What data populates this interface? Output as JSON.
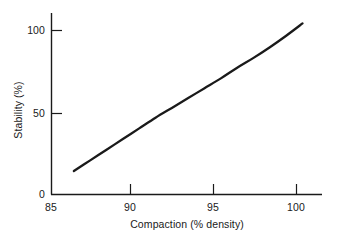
{
  "chart_data": {
    "type": "line",
    "title": "",
    "subtitle": "",
    "xlabel": "Compaction (% density)",
    "ylabel": "Stability (%)",
    "xlim": [
      85,
      101.6
    ],
    "ylim": [
      0,
      110
    ],
    "xticks": [
      85,
      90,
      95,
      100
    ],
    "xticklabels": [
      "85",
      "90",
      "95",
      "100"
    ],
    "yticks": [
      0,
      50,
      100
    ],
    "yticklabels": [
      "0",
      "50",
      "100"
    ],
    "grid": false,
    "legend": null,
    "tick_direction": "in",
    "spines": [
      "left",
      "bottom"
    ],
    "line_color": "#1a1a1a",
    "line_width": 2.3,
    "annotations": [],
    "x": [
      86.4,
      87.4,
      88.4,
      89.4,
      90.4,
      91.4,
      92.4,
      93.4,
      94.4,
      95.4,
      96.4,
      97.4,
      98.4,
      99.4,
      100.4
    ],
    "values": [
      14.0,
      20.5,
      27.0,
      33.5,
      40.0,
      46.5,
      52.5,
      58.5,
      64.5,
      70.5,
      77.0,
      83.0,
      89.5,
      96.5,
      104.0
    ],
    "series": [
      {
        "name": "Stability vs Compaction",
        "x": [
          86.4,
          87.4,
          88.4,
          89.4,
          90.4,
          91.4,
          92.4,
          93.4,
          94.4,
          95.4,
          96.4,
          97.4,
          98.4,
          99.4,
          100.4
        ],
        "values": [
          14.0,
          20.5,
          27.0,
          33.5,
          40.0,
          46.5,
          52.5,
          58.5,
          64.5,
          70.5,
          77.0,
          83.0,
          89.5,
          96.5,
          104.0
        ]
      }
    ]
  },
  "axis": {
    "x_tick_labels": [
      {
        "text": "85",
        "px": 51
      },
      {
        "text": "90",
        "px": 130
      },
      {
        "text": "95",
        "px": 213
      },
      {
        "text": "100",
        "px": 296
      }
    ],
    "y_tick_labels": [
      {
        "text": "0",
        "py": 194
      },
      {
        "text": "50",
        "py": 113
      },
      {
        "text": "100",
        "py": 30
      }
    ],
    "xlabel": "Compaction (% density)",
    "ylabel": "Stability (%)"
  },
  "colors": {
    "background": "#ffffff",
    "foreground": "#1a1a1a",
    "line": "#1a1a1a"
  }
}
